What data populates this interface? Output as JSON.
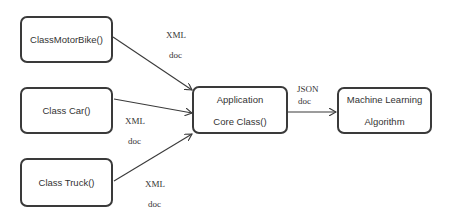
{
  "diagram": {
    "type": "flow",
    "nodes": [
      {
        "id": "motorbike",
        "lines": [
          "ClassMotorBike()"
        ]
      },
      {
        "id": "car",
        "lines": [
          "Class Car()"
        ]
      },
      {
        "id": "truck",
        "lines": [
          "Class Truck()"
        ]
      },
      {
        "id": "core",
        "lines": [
          "Application",
          "Core Class()"
        ]
      },
      {
        "id": "ml",
        "lines": [
          "Machine Learning",
          "Algorithm"
        ]
      }
    ],
    "edges": [
      {
        "from": "motorbike",
        "to": "core",
        "label_top": "XML",
        "label_bottom": "doc"
      },
      {
        "from": "car",
        "to": "core",
        "label_top": "XML",
        "label_bottom": "doc"
      },
      {
        "from": "truck",
        "to": "core",
        "label_top": "XML",
        "label_bottom": "doc"
      },
      {
        "from": "core",
        "to": "ml",
        "label_top": "JSON",
        "label_bottom": "doc"
      }
    ],
    "colors": {
      "stroke": "#3a3a3a",
      "text": "#333333",
      "background": "#ffffff"
    }
  }
}
